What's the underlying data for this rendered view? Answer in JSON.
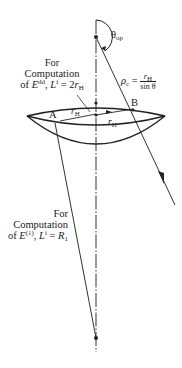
{
  "diagram": {
    "angle_label": "θ",
    "angle_sub": "op",
    "rho_label": "ρ",
    "rho_sub": "c",
    "rho_eq": " = ",
    "rho_num": "r",
    "rho_num_sub": "H",
    "rho_den": "sin θ",
    "point_a": "A",
    "point_b": "B",
    "r_h_upper": "r",
    "r_h_upper_sub": "H",
    "r_h_lower": "r",
    "r_h_lower_sub": "H",
    "upper_note": {
      "line1": "For",
      "line2": "Computation",
      "line3_pre": "of ",
      "line3_e": "E",
      "line3_sup": "dd",
      "line3_mid": ", ",
      "line3_l": "L",
      "line3_lsup": "i",
      "line3_eq": " = 2",
      "line3_r": "r",
      "line3_rsub": "H"
    },
    "lower_note": {
      "line1": "For",
      "line2": "Computation",
      "line3_pre": "of ",
      "line3_e": "E",
      "line3_sup": "(1)",
      "line3_mid": ", ",
      "line3_l": "L",
      "line3_lsup": "i",
      "line3_eq": " = ",
      "line3_r": "R",
      "line3_rsub": "1"
    },
    "colors": {
      "ink": "#222222",
      "background": "#ffffff"
    }
  }
}
